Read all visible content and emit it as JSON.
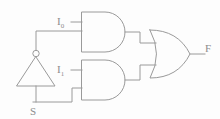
{
  "diagram": {
    "stroke_color": "#9a9a9a",
    "label_color": "#8c8c8c",
    "background_color": "#fdfdfd"
  },
  "labels": {
    "input_0": "I",
    "input_0_sub": "0",
    "input_1": "I",
    "input_1_sub": "1",
    "select": "S",
    "output": "F"
  },
  "gates": [
    {
      "name": "and-gate-top",
      "type": "AND",
      "inputs": [
        "I0",
        "S_not"
      ],
      "output": "and0"
    },
    {
      "name": "and-gate-bottom",
      "type": "AND",
      "inputs": [
        "I1",
        "S"
      ],
      "output": "and1"
    },
    {
      "name": "or-gate",
      "type": "OR",
      "inputs": [
        "and0",
        "and1"
      ],
      "output": "F"
    },
    {
      "name": "not-gate",
      "type": "NOT",
      "inputs": [
        "S"
      ],
      "output": "S_not"
    }
  ]
}
